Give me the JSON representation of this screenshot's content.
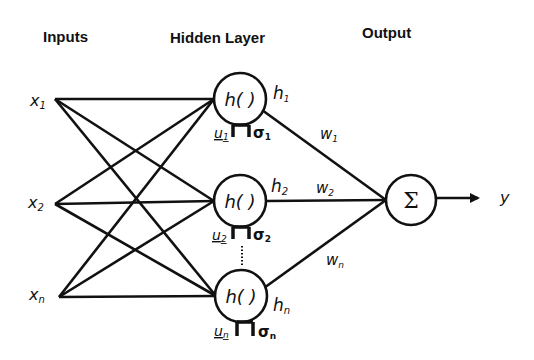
{
  "headers": {
    "inputs": "Inputs",
    "hidden": "Hidden Layer",
    "output": "Output"
  },
  "inputs": [
    {
      "label": "x",
      "sub": "1"
    },
    {
      "label": "x",
      "sub": "2"
    },
    {
      "label": "x",
      "sub": "n"
    }
  ],
  "hidden": [
    {
      "func": "h( )",
      "out": "h",
      "out_sub": "1",
      "u": "u",
      "u_sub": "1",
      "sigma": "σ",
      "sigma_sub": "1",
      "weight": "w",
      "weight_sub": "1"
    },
    {
      "func": "h( )",
      "out": "h",
      "out_sub": "2",
      "u": "u",
      "u_sub": "2",
      "sigma": "σ",
      "sigma_sub": "2",
      "weight": "w",
      "weight_sub": "2"
    },
    {
      "func": "h( )",
      "out": "h",
      "out_sub": "n",
      "u": "u",
      "u_sub": "n",
      "sigma": "σ",
      "sigma_sub": "n",
      "weight": "w",
      "weight_sub": "n"
    }
  ],
  "output": {
    "symbol": "Σ",
    "label": "y"
  }
}
